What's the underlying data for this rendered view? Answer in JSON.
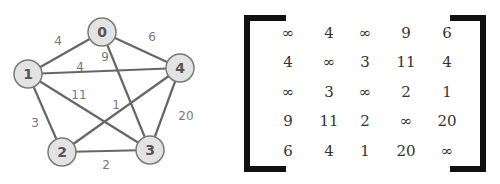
{
  "graph": {
    "nodes": [
      {
        "id": "0",
        "x": 102,
        "y": 32
      },
      {
        "id": "1",
        "x": 28,
        "y": 74
      },
      {
        "id": "2",
        "x": 62,
        "y": 152
      },
      {
        "id": "3",
        "x": 150,
        "y": 150
      },
      {
        "id": "4",
        "x": 180,
        "y": 68
      }
    ],
    "edges": [
      {
        "from": "0",
        "to": "1",
        "weight": "4",
        "lx": 58,
        "ly": 41
      },
      {
        "from": "0",
        "to": "4",
        "weight": "6",
        "lx": 152,
        "ly": 37
      },
      {
        "from": "0",
        "to": "3",
        "weight": "9",
        "lx": 105,
        "ly": 57
      },
      {
        "from": "1",
        "to": "4",
        "weight": "4",
        "lx": 80,
        "ly": 67
      },
      {
        "from": "1",
        "to": "3",
        "weight": "11",
        "lx": 79,
        "ly": 95
      },
      {
        "from": "1",
        "to": "2",
        "weight": "3",
        "lx": 35,
        "ly": 123
      },
      {
        "from": "2",
        "to": "4",
        "weight": "1",
        "lx": 116,
        "ly": 105
      },
      {
        "from": "2",
        "to": "3",
        "weight": "2",
        "lx": 106,
        "ly": 165
      },
      {
        "from": "3",
        "to": "4",
        "weight": "20",
        "lx": 186,
        "ly": 116
      }
    ]
  },
  "matrix": {
    "rows": [
      [
        "∞",
        "4",
        "∞",
        "9",
        "6"
      ],
      [
        "4",
        "∞",
        "3",
        "11",
        "4"
      ],
      [
        "∞",
        "3",
        "∞",
        "2",
        "1"
      ],
      [
        "9",
        "11",
        "2",
        "∞",
        "20"
      ],
      [
        "6",
        "4",
        "1",
        "20",
        "∞"
      ]
    ]
  }
}
